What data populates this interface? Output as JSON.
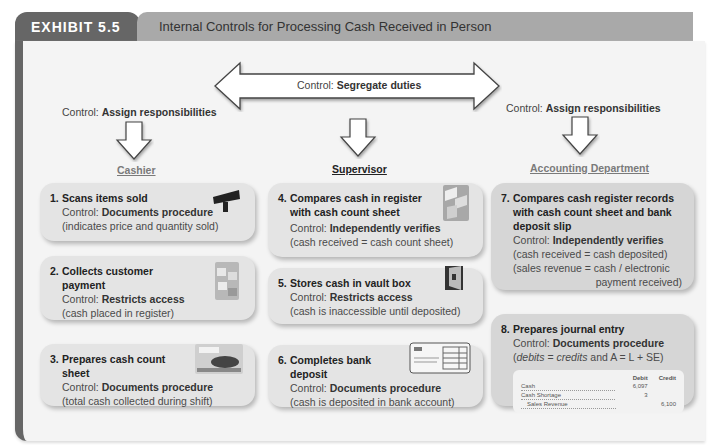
{
  "header": {
    "exhibit_label": "EXHIBIT 5.5",
    "title": "Internal Controls for Processing Cash Received in Person"
  },
  "top_controls": {
    "segregate": {
      "prefix": "Control: ",
      "value": "Segregate duties"
    },
    "left_assign": {
      "prefix": "Control: ",
      "value": "Assign responsibilities"
    },
    "right_assign": {
      "prefix": "Control: ",
      "value": "Assign responsibilities"
    }
  },
  "roles": {
    "cashier": "Cashier",
    "supervisor": "Supervisor",
    "accounting": "Accounting Department"
  },
  "steps": [
    {
      "num": "1.",
      "title": "Scans items sold",
      "control_prefix": "Control: ",
      "control": "Documents procedure",
      "note": "(indicates price and quantity sold)",
      "icon": "barcode-scanner-icon"
    },
    {
      "num": "2.",
      "title": "Collects customer payment",
      "control_prefix": "Control: ",
      "control": "Restricts access",
      "note": "(cash placed in register)",
      "icon": "cash-register-drawer-icon"
    },
    {
      "num": "3.",
      "title": "Prepares cash count sheet",
      "control_prefix": "Control: ",
      "control": "Documents procedure",
      "note": "(total cash collected during shift)",
      "icon": "counting-cash-icon"
    },
    {
      "num": "4.",
      "title": "Compares cash in register with cash count sheet",
      "control_prefix": "Control: ",
      "control": "Independently verifies",
      "note": "(cash received = cash count sheet)",
      "icon": "cash-drawer-icon"
    },
    {
      "num": "5.",
      "title": "Stores cash in vault box",
      "control_prefix": "Control: ",
      "control": "Restricts access",
      "note": "(cash is inaccessible until deposited)",
      "icon": "vault-safe-icon"
    },
    {
      "num": "6.",
      "title": "Completes bank deposit",
      "control_prefix": "Control: ",
      "control": "Documents procedure",
      "note": "(cash is deposited in bank account)",
      "icon": "deposit-slip-icon"
    },
    {
      "num": "7.",
      "title": "Compares cash register records with cash count sheet and bank deposit slip",
      "control_prefix": "Control: ",
      "control": "Independently verifies",
      "note": "(cash received = cash deposited)",
      "note2": "(sales revenue = cash / electronic",
      "note3": "payment received)"
    },
    {
      "num": "8.",
      "title": "Prepares journal entry",
      "control_prefix": "Control: ",
      "control": "Documents procedure",
      "note_a": "(",
      "note_b": "debits",
      "note_c": " = ",
      "note_d": "credits",
      "note_e": " and A = L + SE)"
    }
  ],
  "journal": {
    "headers": {
      "debit": "Debit",
      "credit": "Credit"
    },
    "rows": [
      {
        "account": "Cash",
        "debit": "6,097",
        "credit": ""
      },
      {
        "account": "Cash Shortage",
        "debit": "3",
        "credit": ""
      },
      {
        "account": "Sales Revenue",
        "debit": "",
        "credit": "6,100"
      }
    ]
  }
}
